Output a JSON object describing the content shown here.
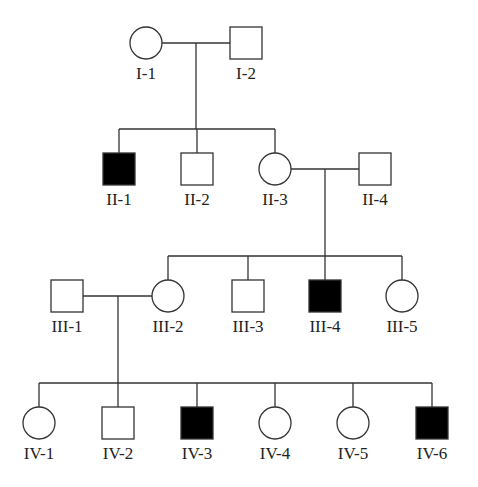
{
  "diagram": {
    "type": "pedigree",
    "legend": {
      "filled": "affected",
      "open": "unaffected",
      "square": "male",
      "circle": "female"
    },
    "individuals": [
      {
        "id": "I-1",
        "label": "I-1",
        "sex": "female",
        "affected": false,
        "x": 146,
        "y": 43
      },
      {
        "id": "I-2",
        "label": "I-2",
        "sex": "male",
        "affected": false,
        "x": 246,
        "y": 43
      },
      {
        "id": "II-1",
        "label": "II-1",
        "sex": "male",
        "affected": true,
        "x": 119,
        "y": 169
      },
      {
        "id": "II-2",
        "label": "II-2",
        "sex": "male",
        "affected": false,
        "x": 197,
        "y": 169
      },
      {
        "id": "II-3",
        "label": "II-3",
        "sex": "female",
        "affected": false,
        "x": 275,
        "y": 169
      },
      {
        "id": "II-4",
        "label": "II-4",
        "sex": "male",
        "affected": false,
        "x": 375,
        "y": 169
      },
      {
        "id": "III-1",
        "label": "III-1",
        "sex": "male",
        "affected": false,
        "x": 67,
        "y": 296
      },
      {
        "id": "III-2",
        "label": "III-2",
        "sex": "female",
        "affected": false,
        "x": 168,
        "y": 296
      },
      {
        "id": "III-3",
        "label": "III-3",
        "sex": "male",
        "affected": false,
        "x": 248,
        "y": 296
      },
      {
        "id": "III-4",
        "label": "III-4",
        "sex": "male",
        "affected": true,
        "x": 325,
        "y": 296
      },
      {
        "id": "III-5",
        "label": "III-5",
        "sex": "female",
        "affected": false,
        "x": 402,
        "y": 296
      },
      {
        "id": "IV-1",
        "label": "IV-1",
        "sex": "female",
        "affected": false,
        "x": 39,
        "y": 423
      },
      {
        "id": "IV-2",
        "label": "IV-2",
        "sex": "male",
        "affected": false,
        "x": 118,
        "y": 423
      },
      {
        "id": "IV-3",
        "label": "IV-3",
        "sex": "male",
        "affected": true,
        "x": 197,
        "y": 423
      },
      {
        "id": "IV-4",
        "label": "IV-4",
        "sex": "female",
        "affected": false,
        "x": 275,
        "y": 423
      },
      {
        "id": "IV-5",
        "label": "IV-5",
        "sex": "female",
        "affected": false,
        "x": 353,
        "y": 423
      },
      {
        "id": "IV-6",
        "label": "IV-6",
        "sex": "male",
        "affected": true,
        "x": 432,
        "y": 423
      }
    ],
    "marriages": [
      {
        "partners": [
          "I-1",
          "I-2"
        ],
        "children": [
          "II-1",
          "II-2",
          "II-3"
        ]
      },
      {
        "partners": [
          "II-3",
          "II-4"
        ],
        "children": [
          "III-2",
          "III-3",
          "III-4",
          "III-5"
        ]
      },
      {
        "partners": [
          "III-1",
          "III-2"
        ],
        "children": [
          "IV-1",
          "IV-2",
          "IV-3",
          "IV-4",
          "IV-5",
          "IV-6"
        ]
      }
    ],
    "colors": {
      "line": "#333333",
      "affected_fill": "#000000",
      "unaffected_fill": "#ffffff"
    }
  }
}
